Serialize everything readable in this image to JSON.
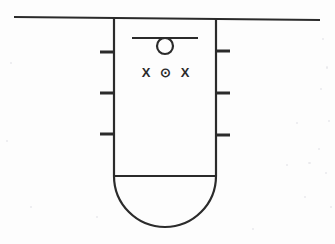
{
  "figure": {
    "background_color": "#fdfdfd",
    "ink_color": "#2b2b2b",
    "canvas": {
      "width": 335,
      "height": 244
    }
  },
  "ground_line": {
    "name": "ground-surface-line",
    "x1": 14,
    "y1": 17,
    "x2": 320,
    "y2": 20,
    "stroke_width": 2.2
  },
  "shaft": {
    "name": "vertical-shaft",
    "left_wall_x": 114,
    "right_wall_x": 216,
    "top_y": 18,
    "bottom_y": 176,
    "stroke_width": 2.2
  },
  "rounded_base": {
    "name": "semicircular-base",
    "center_x": 165,
    "center_y": 176,
    "radius": 51,
    "chord_y": 176,
    "stroke_width": 2.2
  },
  "wall_ticks": {
    "name": "wall-tick-marks",
    "length": 14,
    "stroke_width": 3,
    "left": [
      {
        "label": "left-tick-1",
        "y": 52
      },
      {
        "label": "left-tick-2",
        "y": 93
      },
      {
        "label": "left-tick-3",
        "y": 134
      }
    ],
    "right": [
      {
        "label": "right-tick-1",
        "y": 51
      },
      {
        "label": "right-tick-2",
        "y": 93
      },
      {
        "label": "right-tick-3",
        "y": 135
      }
    ]
  },
  "suspension_bar": {
    "name": "horizontal-support-bar",
    "x1": 132,
    "x2": 198,
    "y": 38,
    "stroke_width": 2.2
  },
  "ball": {
    "name": "suspended-circle",
    "center_x": 165,
    "center_y": 46,
    "radius": 8,
    "stroke_width": 2.2
  },
  "field_symbols": {
    "name": "field-direction-symbols",
    "row_y": 74,
    "items": [
      {
        "name": "field-symbol-x-left",
        "glyph": "X",
        "x": 146
      },
      {
        "name": "field-symbol-dot",
        "glyph": "⊙",
        "x": 165
      },
      {
        "name": "field-symbol-x-right",
        "glyph": "X",
        "x": 185
      }
    ],
    "font_size": 13,
    "font_weight": "bold"
  },
  "scan_artifacts": {
    "name": "scan-speckles",
    "color": "#e9e9ec",
    "flecks": [
      {
        "x": 322,
        "y": 38,
        "w": 2,
        "h": 2
      },
      {
        "x": 326,
        "y": 66,
        "w": 2,
        "h": 3
      },
      {
        "x": 320,
        "y": 88,
        "w": 2,
        "h": 2
      },
      {
        "x": 328,
        "y": 120,
        "w": 2,
        "h": 2
      },
      {
        "x": 318,
        "y": 148,
        "w": 2,
        "h": 2
      },
      {
        "x": 325,
        "y": 172,
        "w": 2,
        "h": 2
      },
      {
        "x": 308,
        "y": 162,
        "w": 3,
        "h": 2
      },
      {
        "x": 296,
        "y": 122,
        "w": 2,
        "h": 2
      },
      {
        "x": 304,
        "y": 196,
        "w": 2,
        "h": 2
      },
      {
        "x": 330,
        "y": 206,
        "w": 2,
        "h": 2
      },
      {
        "x": 286,
        "y": 164,
        "w": 2,
        "h": 2
      },
      {
        "x": 10,
        "y": 62,
        "w": 2,
        "h": 2
      },
      {
        "x": 6,
        "y": 140,
        "w": 2,
        "h": 2
      },
      {
        "x": 30,
        "y": 206,
        "w": 2,
        "h": 2
      },
      {
        "x": 96,
        "y": 216,
        "w": 2,
        "h": 2
      },
      {
        "x": 252,
        "y": 228,
        "w": 2,
        "h": 2
      }
    ]
  }
}
